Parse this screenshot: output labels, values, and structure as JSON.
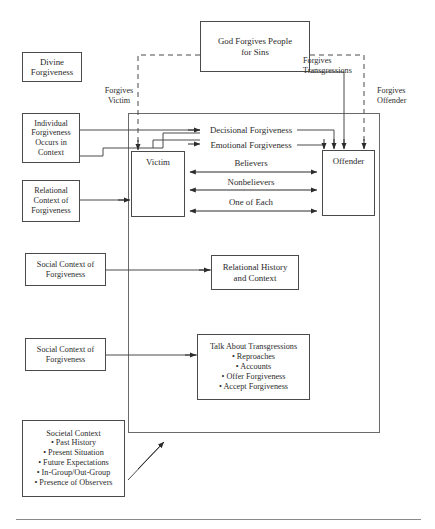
{
  "diagram": {
    "boxes": {
      "divine_forgiveness": {
        "lines": [
          "Divine",
          "Forgiveness"
        ]
      },
      "god_forgives": {
        "lines": [
          "God Forgives People",
          "for Sins"
        ]
      },
      "individual_forgiveness": {
        "lines": [
          "Individual",
          "Forgiveness",
          "Occurs in",
          "Context"
        ]
      },
      "relational_context": {
        "lines": [
          "Relational",
          "Context of",
          "Forgiveness"
        ]
      },
      "victim": {
        "lines": [
          "Victim"
        ]
      },
      "offender": {
        "lines": [
          "Offender"
        ]
      },
      "social_context_1": {
        "lines": [
          "Social Context of",
          "Forgiveness"
        ]
      },
      "relational_history": {
        "lines": [
          "Relational History",
          "and Context"
        ]
      },
      "social_context_2": {
        "lines": [
          "Social Context of",
          "Forgiveness"
        ]
      },
      "talk_about_transgressions": {
        "heading": "Talk About Transgressions",
        "bullets": [
          "Reproaches",
          "Accounts",
          "Offer Forgiveness",
          "Accept Forgiveness"
        ]
      },
      "societal_context": {
        "heading": "Societal Context",
        "bullets": [
          "Past History",
          "Present Situation",
          "Future Expectations",
          "In-Group/Out-Group",
          "Presence of Observers"
        ]
      }
    },
    "edge_labels": {
      "forgives_victim": {
        "lines": [
          "Forgives",
          "Victim"
        ]
      },
      "forgives_transgressions": {
        "lines": [
          "Forgives",
          "Transgressions"
        ]
      },
      "forgives_offender": {
        "lines": [
          "Forgives",
          "Offender"
        ]
      },
      "decisional_forgiveness": "Decisional Forgiveness",
      "emotional_forgiveness": "Emotional Forgiveness",
      "believers": "Believers",
      "nonbelievers": "Nonbelievers",
      "one_of_each": "One of Each"
    },
    "colors": {
      "stroke": "#4a4a4a",
      "frame": "#6a6a6a",
      "text": "#2b2b2b",
      "background": "#ffffff",
      "rule": "#8a8a8a"
    }
  }
}
